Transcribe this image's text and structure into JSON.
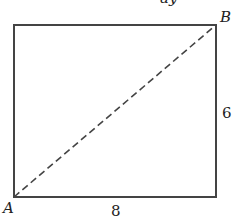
{
  "diagram": {
    "type": "rectangle-with-diagonal",
    "top_fragment": "ay",
    "vertices": {
      "bottom_left": "A",
      "top_right": "B"
    },
    "side_labels": {
      "bottom": "8",
      "right": "6"
    },
    "diagonal": {
      "from": "A",
      "to": "B",
      "style": "dashed"
    },
    "colors": {
      "stroke": "#444444",
      "text": "#222222",
      "background": "#ffffff"
    }
  }
}
